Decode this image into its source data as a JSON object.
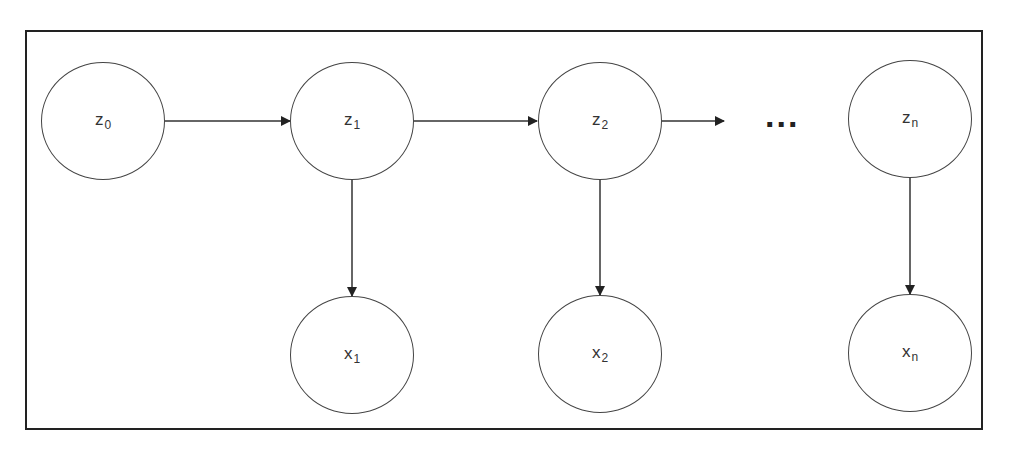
{
  "diagram": {
    "type": "hidden-markov-model",
    "hidden_states": [
      {
        "id": "z0",
        "base": "z",
        "sub": "0"
      },
      {
        "id": "z1",
        "base": "z",
        "sub": "1"
      },
      {
        "id": "z2",
        "base": "z",
        "sub": "2"
      },
      {
        "id": "zn",
        "base": "z",
        "sub": "n"
      }
    ],
    "observations": [
      {
        "id": "x1",
        "base": "x",
        "sub": "1"
      },
      {
        "id": "x2",
        "base": "x",
        "sub": "2"
      },
      {
        "id": "xn",
        "base": "x",
        "sub": "n"
      }
    ],
    "ellipsis": "...",
    "edges": [
      {
        "from": "z0",
        "to": "z1"
      },
      {
        "from": "z1",
        "to": "z2"
      },
      {
        "from": "z2",
        "to": "..."
      },
      {
        "from": "z1",
        "to": "x1"
      },
      {
        "from": "z2",
        "to": "x2"
      },
      {
        "from": "zn",
        "to": "xn"
      }
    ],
    "colors": {
      "stroke": "#333333",
      "frame": "#222222",
      "background": "#ffffff"
    }
  }
}
